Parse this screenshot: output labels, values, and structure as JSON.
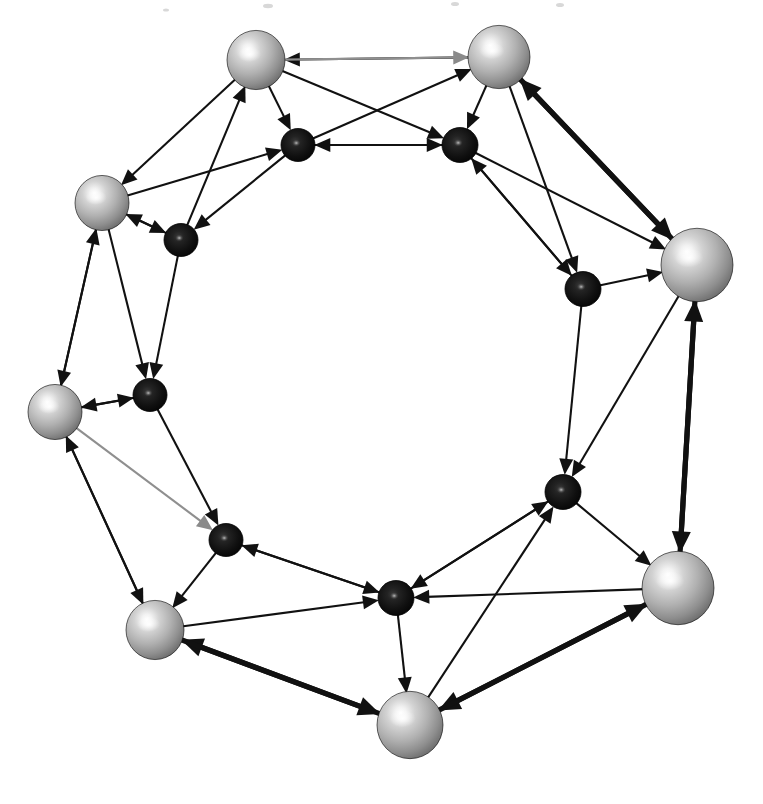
{
  "figure": {
    "background_color": "#ffffff",
    "width": 763,
    "height": 804,
    "line_color": "#111111",
    "faint_line_color": "#8f8f8f"
  },
  "legend": {
    "outer_node_kind": "large light-grey shaded sphere",
    "inner_node_kind": "small dark shaded sphere",
    "edge_kind": "straight directed segment with solid triangular arrowhead"
  },
  "chart_data": {
    "type": "diagram",
    "xlabel": "",
    "ylabel": "",
    "node_count": 16,
    "edge_count": 34,
    "layout": "two concentric rings, eight outer light spheres alternating with eight inner dark spheres",
    "outer_ring_color": "#b9b9b9",
    "inner_ring_color": "#111111",
    "nodes": [
      {
        "id": "O1",
        "label": "",
        "ring": "outer",
        "x": 256,
        "y": 60,
        "r": 29,
        "color": "#b5b5b5"
      },
      {
        "id": "O2",
        "label": "",
        "ring": "outer",
        "x": 499,
        "y": 57,
        "r": 31,
        "color": "#b5b5b5"
      },
      {
        "id": "O3",
        "label": "",
        "ring": "outer",
        "x": 697,
        "y": 265,
        "r": 36,
        "color": "#b5b5b5"
      },
      {
        "id": "O4",
        "label": "",
        "ring": "outer",
        "x": 678,
        "y": 588,
        "r": 36,
        "color": "#b5b5b5"
      },
      {
        "id": "O5",
        "label": "",
        "ring": "outer",
        "x": 410,
        "y": 725,
        "r": 33,
        "color": "#b5b5b5"
      },
      {
        "id": "O6",
        "label": "",
        "ring": "outer",
        "x": 155,
        "y": 630,
        "r": 29,
        "color": "#b5b5b5"
      },
      {
        "id": "O7",
        "label": "",
        "ring": "outer",
        "x": 55,
        "y": 412,
        "r": 27,
        "color": "#b5b5b5"
      },
      {
        "id": "O8",
        "label": "",
        "ring": "outer",
        "x": 102,
        "y": 203,
        "r": 27,
        "color": "#b5b5b5"
      },
      {
        "id": "I1",
        "label": "",
        "ring": "inner",
        "x": 298,
        "y": 145,
        "r": 17,
        "color": "#0d0d0d"
      },
      {
        "id": "I2",
        "label": "",
        "ring": "inner",
        "x": 460,
        "y": 145,
        "r": 18,
        "color": "#0d0d0d"
      },
      {
        "id": "I3",
        "label": "",
        "ring": "inner",
        "x": 583,
        "y": 289,
        "r": 18,
        "color": "#0d0d0d"
      },
      {
        "id": "I4",
        "label": "",
        "ring": "inner",
        "x": 563,
        "y": 492,
        "r": 18,
        "color": "#0d0d0d"
      },
      {
        "id": "I5",
        "label": "",
        "ring": "inner",
        "x": 396,
        "y": 598,
        "r": 18,
        "color": "#0d0d0d"
      },
      {
        "id": "I6",
        "label": "",
        "ring": "inner",
        "x": 226,
        "y": 540,
        "r": 17,
        "color": "#0d0d0d"
      },
      {
        "id": "I7",
        "label": "",
        "ring": "inner",
        "x": 150,
        "y": 395,
        "r": 17,
        "color": "#0d0d0d"
      },
      {
        "id": "I8",
        "label": "",
        "ring": "inner",
        "x": 181,
        "y": 240,
        "r": 17,
        "color": "#0d0d0d"
      }
    ],
    "edges": [
      {
        "from": "O2",
        "to": "O1",
        "weight": "thin",
        "faint": false
      },
      {
        "from": "O1",
        "to": "O2",
        "weight": "thin",
        "faint": true
      },
      {
        "from": "O1",
        "to": "I1",
        "weight": "thin",
        "faint": false
      },
      {
        "from": "O1",
        "to": "I2",
        "weight": "thin",
        "faint": false
      },
      {
        "from": "I1",
        "to": "O2",
        "weight": "thin",
        "faint": false
      },
      {
        "from": "O2",
        "to": "I2",
        "weight": "thin",
        "faint": false
      },
      {
        "from": "I1",
        "to": "I2",
        "weight": "thin",
        "faint": false
      },
      {
        "from": "I2",
        "to": "I1",
        "weight": "thin",
        "faint": false
      },
      {
        "from": "I8",
        "to": "O1",
        "weight": "thin",
        "faint": false
      },
      {
        "from": "O8",
        "to": "I1",
        "weight": "thin",
        "faint": false
      },
      {
        "from": "O1",
        "to": "O8",
        "weight": "thin",
        "faint": false
      },
      {
        "from": "O8",
        "to": "I8",
        "weight": "thin",
        "faint": false
      },
      {
        "from": "I8",
        "to": "O8",
        "weight": "thin",
        "faint": false
      },
      {
        "from": "O2",
        "to": "O3",
        "weight": "thick",
        "faint": false
      },
      {
        "from": "O3",
        "to": "O2",
        "weight": "thick",
        "faint": false
      },
      {
        "from": "I2",
        "to": "O3",
        "weight": "thin",
        "faint": false
      },
      {
        "from": "O2",
        "to": "I3",
        "weight": "thin",
        "faint": false
      },
      {
        "from": "I3",
        "to": "O3",
        "weight": "thin",
        "faint": false
      },
      {
        "from": "I2",
        "to": "I3",
        "weight": "thin",
        "faint": false
      },
      {
        "from": "O3",
        "to": "I4",
        "weight": "thin",
        "faint": false
      },
      {
        "from": "I3",
        "to": "I4",
        "weight": "thin",
        "faint": false
      },
      {
        "from": "O3",
        "to": "O4",
        "weight": "thick",
        "faint": false
      },
      {
        "from": "O4",
        "to": "O3",
        "weight": "thick",
        "faint": false
      },
      {
        "from": "I4",
        "to": "O4",
        "weight": "thin",
        "faint": false
      },
      {
        "from": "O4",
        "to": "I5",
        "weight": "thin",
        "faint": false
      },
      {
        "from": "I5",
        "to": "I4",
        "weight": "thin",
        "faint": false
      },
      {
        "from": "O5",
        "to": "I4",
        "weight": "thin",
        "faint": false
      },
      {
        "from": "O4",
        "to": "O5",
        "weight": "thick",
        "faint": false
      },
      {
        "from": "O5",
        "to": "O4",
        "weight": "thick",
        "faint": false
      },
      {
        "from": "I5",
        "to": "O5",
        "weight": "thin",
        "faint": false
      },
      {
        "from": "O6",
        "to": "I5",
        "weight": "thin",
        "faint": false
      },
      {
        "from": "I6",
        "to": "I5",
        "weight": "thin",
        "faint": false
      },
      {
        "from": "O5",
        "to": "O6",
        "weight": "thick",
        "faint": false
      },
      {
        "from": "O6",
        "to": "O5",
        "weight": "thick",
        "faint": false
      },
      {
        "from": "I6",
        "to": "O6",
        "weight": "thin",
        "faint": false
      },
      {
        "from": "O7",
        "to": "I6",
        "weight": "thin",
        "faint": true
      },
      {
        "from": "I7",
        "to": "I6",
        "weight": "thin",
        "faint": false
      },
      {
        "from": "O7",
        "to": "O6",
        "weight": "thin",
        "faint": false
      },
      {
        "from": "O6",
        "to": "O7",
        "weight": "thin",
        "faint": false
      },
      {
        "from": "I7",
        "to": "O7",
        "weight": "thin",
        "faint": false
      },
      {
        "from": "O8",
        "to": "I7",
        "weight": "thin",
        "faint": false
      },
      {
        "from": "O7",
        "to": "I7",
        "weight": "thin",
        "faint": false
      },
      {
        "from": "I8",
        "to": "I7",
        "weight": "thin",
        "faint": false
      },
      {
        "from": "O7",
        "to": "O8",
        "weight": "thin",
        "faint": false
      },
      {
        "from": "O8",
        "to": "O7",
        "weight": "thin",
        "faint": false
      },
      {
        "from": "I1",
        "to": "I8",
        "weight": "thin",
        "faint": false
      },
      {
        "from": "I3",
        "to": "I2",
        "weight": "thin",
        "faint": false
      },
      {
        "from": "I4",
        "to": "I5",
        "weight": "thin",
        "faint": false
      },
      {
        "from": "I5",
        "to": "I6",
        "weight": "thin",
        "faint": false
      }
    ]
  }
}
